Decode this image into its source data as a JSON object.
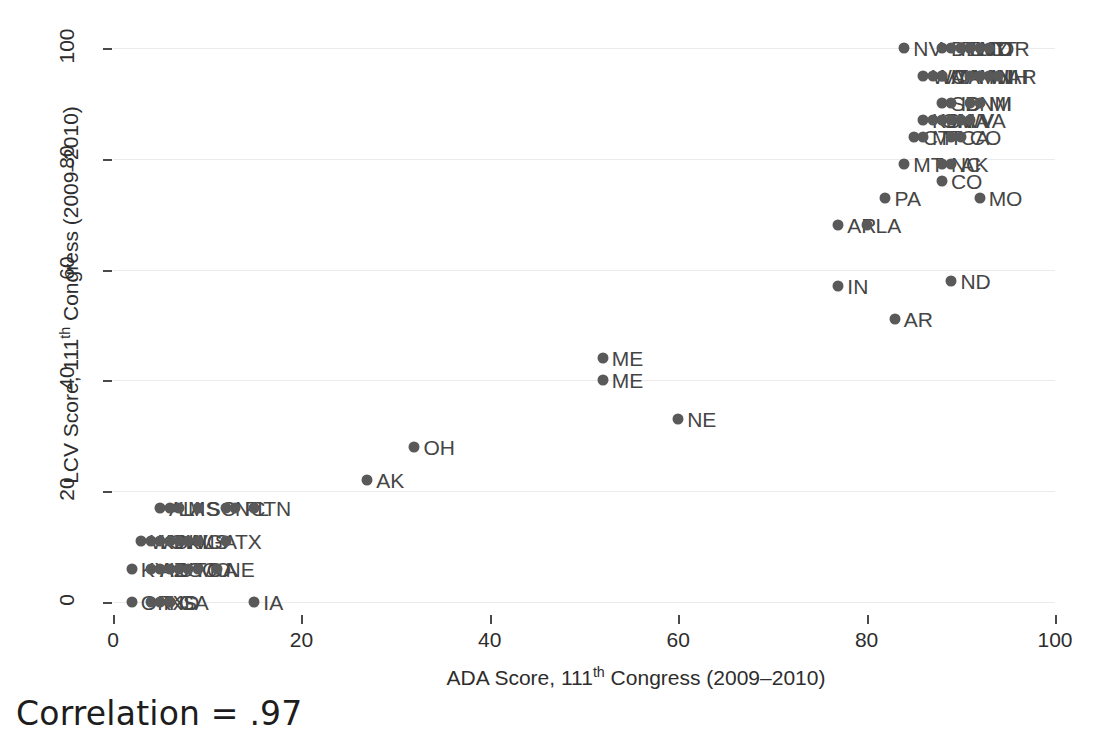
{
  "chart_data": {
    "type": "scatter",
    "title": "",
    "xlabel": "ADA Score, 111th Congress (2009–2010)",
    "ylabel": "LCV Score, 111th Congress (2009–2010)",
    "xlabel_parts": {
      "pre": "ADA Score, 111",
      "sup": "th",
      "post": " Congress (2009–2010)"
    },
    "ylabel_parts": {
      "pre": "LCV Score, 111",
      "sup": "th",
      "post": " Congress (2009–2010)"
    },
    "xlim": [
      0,
      100
    ],
    "ylim": [
      0,
      100
    ],
    "xticks": [
      0,
      20,
      40,
      60,
      80,
      100
    ],
    "yticks": [
      0,
      20,
      40,
      60,
      80,
      100
    ],
    "xticklabels": [
      "0",
      "20",
      "40",
      "60",
      "80",
      "100"
    ],
    "yticklabels": [
      "0",
      "20",
      "40",
      "60",
      "80",
      "100"
    ],
    "grid": "horizontal",
    "legend": "none",
    "marker_color": "#595959",
    "annotation": "Correlation = .97",
    "correlation": 0.97,
    "points": [
      {
        "label": "NV",
        "x": 84,
        "y": 100
      },
      {
        "label": "DE",
        "x": 88,
        "y": 100
      },
      {
        "label": "RI",
        "x": 89,
        "y": 100
      },
      {
        "label": "NJ",
        "x": 90,
        "y": 100
      },
      {
        "label": "IL",
        "x": 90,
        "y": 100
      },
      {
        "label": "MD",
        "x": 91,
        "y": 100
      },
      {
        "label": "NY",
        "x": 91,
        "y": 100
      },
      {
        "label": "CT",
        "x": 92,
        "y": 100
      },
      {
        "label": "OR",
        "x": 93,
        "y": 100
      },
      {
        "label": "WA",
        "x": 86,
        "y": 95
      },
      {
        "label": "VT",
        "x": 87,
        "y": 95
      },
      {
        "label": "MA",
        "x": 88,
        "y": 95
      },
      {
        "label": "CA",
        "x": 88,
        "y": 95
      },
      {
        "label": "MN",
        "x": 91,
        "y": 95
      },
      {
        "label": "HI",
        "x": 92,
        "y": 95
      },
      {
        "label": "WI",
        "x": 92,
        "y": 95
      },
      {
        "label": "NH",
        "x": 93,
        "y": 95
      },
      {
        "label": "AR",
        "x": 94,
        "y": 95
      },
      {
        "label": "SD",
        "x": 88,
        "y": 90
      },
      {
        "label": "ID",
        "x": 89,
        "y": 90
      },
      {
        "label": "NM",
        "x": 91,
        "y": 90
      },
      {
        "label": "MI",
        "x": 92,
        "y": 90
      },
      {
        "label": "KS",
        "x": 86,
        "y": 87
      },
      {
        "label": "OH",
        "x": 87,
        "y": 87
      },
      {
        "label": "IN",
        "x": 88,
        "y": 87
      },
      {
        "label": "WV",
        "x": 89,
        "y": 87
      },
      {
        "label": "IA",
        "x": 90,
        "y": 87
      },
      {
        "label": "VA",
        "x": 91,
        "y": 87
      },
      {
        "label": "CT",
        "x": 85,
        "y": 84
      },
      {
        "label": "MT",
        "x": 86,
        "y": 84
      },
      {
        "label": "CA",
        "x": 89,
        "y": 84
      },
      {
        "label": "CO",
        "x": 90,
        "y": 84
      },
      {
        "label": "MT",
        "x": 84,
        "y": 79
      },
      {
        "label": "NC",
        "x": 88,
        "y": 79
      },
      {
        "label": "AK",
        "x": 89,
        "y": 79
      },
      {
        "label": "CO",
        "x": 88,
        "y": 76
      },
      {
        "label": "PA",
        "x": 82,
        "y": 73
      },
      {
        "label": "MO",
        "x": 92,
        "y": 73
      },
      {
        "label": "AR",
        "x": 77,
        "y": 68
      },
      {
        "label": "LA",
        "x": 80,
        "y": 68
      },
      {
        "label": "IN",
        "x": 77,
        "y": 57
      },
      {
        "label": "ND",
        "x": 89,
        "y": 58
      },
      {
        "label": "AR",
        "x": 83,
        "y": 51
      },
      {
        "label": "ME",
        "x": 52,
        "y": 44
      },
      {
        "label": "ME",
        "x": 52,
        "y": 40
      },
      {
        "label": "NE",
        "x": 60,
        "y": 33
      },
      {
        "label": "OH",
        "x": 32,
        "y": 28
      },
      {
        "label": "AK",
        "x": 27,
        "y": 22
      },
      {
        "label": "AL",
        "x": 5,
        "y": 17
      },
      {
        "label": "LA",
        "x": 6,
        "y": 17
      },
      {
        "label": "MS",
        "x": 7,
        "y": 17
      },
      {
        "label": "SC",
        "x": 9,
        "y": 17
      },
      {
        "label": "NC",
        "x": 12,
        "y": 17
      },
      {
        "label": "FL",
        "x": 13,
        "y": 17
      },
      {
        "label": "TN",
        "x": 15,
        "y": 17
      },
      {
        "label": "WY",
        "x": 3,
        "y": 11
      },
      {
        "label": "KS",
        "x": 4,
        "y": 11
      },
      {
        "label": "OK",
        "x": 5,
        "y": 11
      },
      {
        "label": "NV",
        "x": 6,
        "y": 11
      },
      {
        "label": "AL",
        "x": 7,
        "y": 11
      },
      {
        "label": "MS",
        "x": 8,
        "y": 11
      },
      {
        "label": "GA",
        "x": 9,
        "y": 11
      },
      {
        "label": "TX",
        "x": 12,
        "y": 11
      },
      {
        "label": "KY",
        "x": 2,
        "y": 6
      },
      {
        "label": "AZ",
        "x": 4,
        "y": 6
      },
      {
        "label": "ID",
        "x": 5,
        "y": 6
      },
      {
        "label": "UT",
        "x": 6,
        "y": 6
      },
      {
        "label": "SC",
        "x": 7,
        "y": 6
      },
      {
        "label": "MO",
        "x": 8,
        "y": 6
      },
      {
        "label": "GA",
        "x": 9,
        "y": 6
      },
      {
        "label": "NE",
        "x": 11,
        "y": 6
      },
      {
        "label": "OK",
        "x": 2,
        "y": 0
      },
      {
        "label": "TX",
        "x": 4,
        "y": 0
      },
      {
        "label": "KS",
        "x": 5,
        "y": 0
      },
      {
        "label": "GA",
        "x": 6,
        "y": 0
      },
      {
        "label": "ID",
        "x": 6,
        "y": 0
      },
      {
        "label": "IA",
        "x": 15,
        "y": 0
      }
    ]
  }
}
